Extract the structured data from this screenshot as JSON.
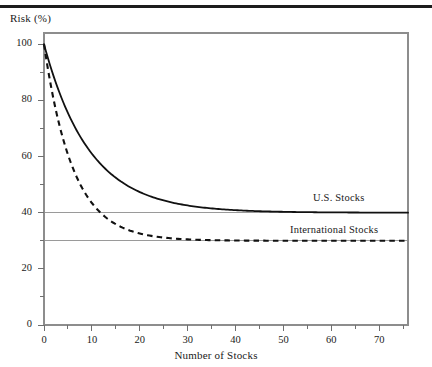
{
  "figure": {
    "top_rule": "horizontal-rule"
  },
  "chart_data": {
    "type": "line",
    "title": "",
    "xlabel": "Number of Stocks",
    "ylabel": "Risk (%)",
    "xlim": [
      0,
      76
    ],
    "ylim": [
      0,
      104
    ],
    "grid": true,
    "grid_lines": [
      40,
      30
    ],
    "legend_position": "inline-right",
    "x_ticks_major": [
      0,
      10,
      20,
      30,
      40,
      50,
      60,
      70
    ],
    "x_ticks_major_labels": [
      "0",
      "10",
      "20",
      "30",
      "40",
      "50",
      "60",
      "70"
    ],
    "x_ticks_minor": [
      5,
      15,
      25,
      35,
      45,
      55,
      65,
      75
    ],
    "y_ticks_major": [
      0,
      20,
      40,
      60,
      80,
      100
    ],
    "y_ticks_major_labels": [
      "0",
      "20",
      "40",
      "60",
      "80",
      "100"
    ],
    "y_ticks_minor": [
      10,
      30,
      50,
      70,
      90
    ],
    "series": [
      {
        "name": "U.S. Stocks",
        "style": "solid",
        "color": "#111111",
        "asymptote": 40,
        "start": 100,
        "decay": 0.105,
        "x": [
          0,
          1,
          2,
          3,
          4,
          5,
          6,
          7,
          8,
          9,
          10,
          12,
          14,
          16,
          18,
          20,
          25,
          30,
          35,
          40,
          45,
          50,
          55,
          60,
          65,
          70,
          75
        ],
        "y": [
          100.0,
          94.0,
          88.6,
          83.8,
          79.4,
          75.5,
          72.0,
          68.7,
          65.8,
          63.2,
          60.9,
          56.8,
          53.4,
          50.6,
          48.3,
          46.3,
          42.7,
          40.0,
          40.0,
          40.0,
          40.0,
          40.0,
          40.0,
          40.0,
          40.0,
          40.0,
          40.0
        ]
      },
      {
        "name": "International Stocks",
        "style": "dashed",
        "color": "#111111",
        "asymptote": 30,
        "start": 100,
        "decay": 0.165,
        "x": [
          0,
          1,
          2,
          3,
          4,
          5,
          6,
          7,
          8,
          9,
          10,
          12,
          14,
          16,
          18,
          20,
          25,
          30,
          35,
          40,
          45,
          50,
          55,
          60,
          65,
          70,
          75
        ],
        "y": [
          100.0,
          89.4,
          80.4,
          72.7,
          66.2,
          60.7,
          56.0,
          52.0,
          48.6,
          45.7,
          43.2,
          39.3,
          36.5,
          34.5,
          33.1,
          32.0,
          30.8,
          30.2,
          30.0,
          30.0,
          30.0,
          30.0,
          30.0,
          30.0,
          30.0,
          30.0,
          30.0
        ]
      }
    ],
    "annotations": [
      {
        "text": "U.S. Stocks",
        "x_px": 313,
        "y_px": 192
      },
      {
        "text": "International Stocks",
        "x_px": 290,
        "y_px": 224
      }
    ]
  }
}
